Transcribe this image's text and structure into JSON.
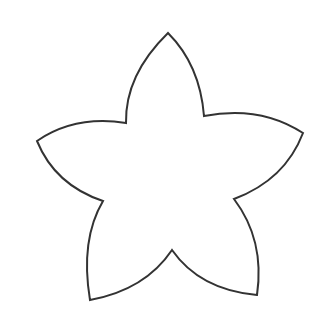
{
  "image": {
    "subject": "five-petal star flower outline",
    "background": "#ffffff",
    "stroke": "#333333",
    "stroke_width": 2
  }
}
